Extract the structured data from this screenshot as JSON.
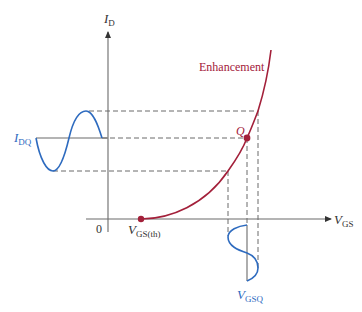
{
  "diagram": {
    "type": "transfer-characteristic",
    "colors": {
      "axis": "#6b6b6b",
      "curve": "#a3203a",
      "signal": "#2e6bbf",
      "dashed": "#6b6b6b",
      "text": "#333333"
    },
    "labels": {
      "y_axis": "I",
      "y_axis_sub": "D",
      "x_axis": "V",
      "x_axis_sub": "GS",
      "origin": "0",
      "threshold": "V",
      "threshold_sub": "GS(th)",
      "curve_name": "Enhancement",
      "q_point": "Q",
      "idq": "I",
      "idq_sub": "DQ",
      "vgsq": "V",
      "vgsq_sub": "GSQ"
    }
  }
}
